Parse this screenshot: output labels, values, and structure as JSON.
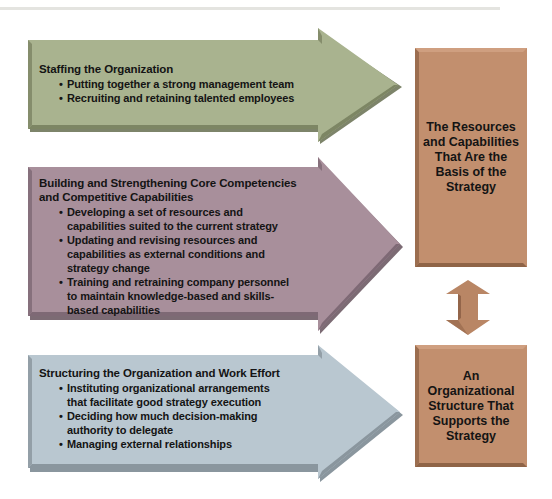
{
  "diagram": {
    "colors": {
      "staffing": "#a9b38f",
      "core_competencies": "#a88f9b",
      "structuring": "#b9c7d0",
      "outcome_box": "#c28f6e"
    },
    "arrows": [
      {
        "heading": "Staffing the Organization",
        "bullets": [
          "Putting together a strong management team",
          "Recruiting and retaining talented employees"
        ]
      },
      {
        "heading": "Building and Strengthening Core Competencies and Competitive Capabilities",
        "bullets": [
          "Developing a set of resources and capabilities suited to the current strategy",
          "Updating and revising resources and capabilities as external conditions and strategy change",
          "Training and retraining company personnel to maintain knowledge-based and skills-based capabilities"
        ]
      },
      {
        "heading": "Structuring the Organization and Work Effort",
        "bullets": [
          "Instituting organizational arrangements that facilitate good strategy execution",
          "Deciding how much decision-making authority to delegate",
          "Managing external relationships"
        ]
      }
    ],
    "boxes": [
      {
        "label": "The Resources\nand Capabilities\nThat Are the\nBasis of the\nStrategy"
      },
      {
        "label": "An\nOrganizational\nStructure That\nSupports the\nStrategy"
      }
    ],
    "connector": "double-headed-arrow"
  }
}
